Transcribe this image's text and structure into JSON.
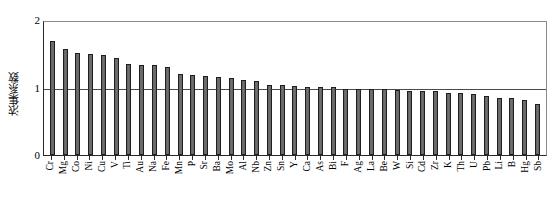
{
  "chart_data": {
    "type": "bar",
    "title": "",
    "xlabel": "",
    "ylabel": "浓集系数",
    "ylim": [
      0,
      2
    ],
    "yticks": [
      "0",
      "1",
      "2"
    ],
    "grid": true,
    "gridlines": [
      1,
      2
    ],
    "legend": "none",
    "bar_color": "#666666",
    "bar_edge_color": "#1f1f1f",
    "axis_color": "#2a2a2a",
    "categories": [
      "Cr",
      "Mg",
      "Co",
      "Ni",
      "Cu",
      "V",
      "Ti",
      "Au",
      "Na",
      "Fe",
      "Mn",
      "P",
      "Sr",
      "Ba",
      "Mo",
      "Al",
      "Nb",
      "Zn",
      "Sn",
      "Y",
      "Ca",
      "As",
      "Bi",
      "F",
      "Ag",
      "La",
      "Be",
      "W",
      "Si",
      "Cd",
      "Zr",
      "K",
      "Th",
      "U",
      "Pb",
      "Li",
      "B",
      "Hg",
      "Sb"
    ],
    "values": [
      1.72,
      1.6,
      1.54,
      1.52,
      1.51,
      1.46,
      1.37,
      1.35,
      1.35,
      1.33,
      1.22,
      1.2,
      1.19,
      1.17,
      1.16,
      1.13,
      1.12,
      1.06,
      1.05,
      1.04,
      1.03,
      1.03,
      1.02,
      1.0,
      0.99,
      0.99,
      0.99,
      0.98,
      0.97,
      0.97,
      0.96,
      0.94,
      0.93,
      0.92,
      0.88,
      0.85,
      0.85,
      0.82,
      0.76
    ]
  },
  "y_axis": {
    "label": "浓集系数",
    "tick_top": "2",
    "tick_mid": "1",
    "tick_bottom": "0"
  }
}
